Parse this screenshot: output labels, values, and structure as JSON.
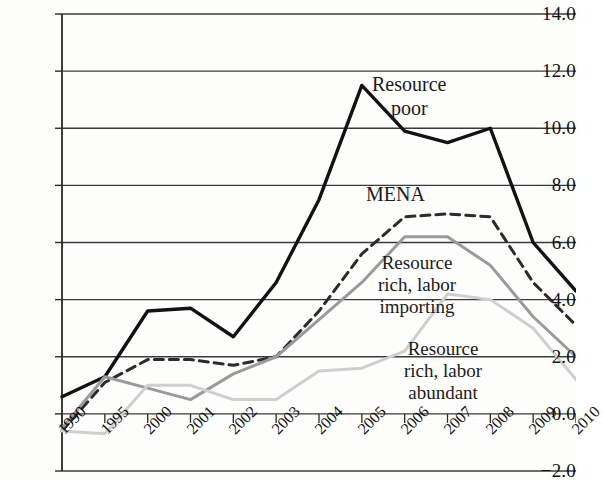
{
  "chart_data": {
    "type": "line",
    "title": "",
    "subtitle": "",
    "xlabel": "",
    "ylabel": "",
    "categories": [
      "1990",
      "1995",
      "2000",
      "2001",
      "2002",
      "2003",
      "2004",
      "2005",
      "2006",
      "2007",
      "2008",
      "2009",
      "2010"
    ],
    "ylim": [
      -2.0,
      14.0
    ],
    "ytick_values": [
      14.0,
      12.0,
      10.0,
      8.0,
      6.0,
      4.0,
      2.0,
      0.0,
      -2.0
    ],
    "ytick_labels": [
      "14.0",
      "12.0",
      "10.0",
      "8.0",
      "6.0",
      "4.0",
      "2.0",
      "0.0",
      "-2.0"
    ],
    "grid": "horizontal",
    "legend": "inline-annotations",
    "series": [
      {
        "name": "Resource poor",
        "style": "solid",
        "color": "#121212",
        "width": 3.4,
        "values": [
          0.6,
          1.3,
          3.6,
          3.7,
          2.7,
          4.6,
          7.5,
          11.5,
          9.9,
          9.5,
          10.0,
          6.0,
          4.3
        ]
      },
      {
        "name": "MENA",
        "style": "dashed",
        "color": "#2b2b2b",
        "width": 3.0,
        "values": [
          -0.6,
          1.1,
          1.9,
          1.9,
          1.7,
          2.0,
          3.6,
          5.6,
          6.9,
          7.0,
          6.9,
          4.6,
          3.1
        ]
      },
      {
        "name": "Resource rich, labor importing",
        "style": "solid",
        "color": "#9a9a9a",
        "width": 3.0,
        "values": [
          -0.5,
          1.3,
          0.9,
          0.5,
          1.4,
          2.0,
          3.3,
          4.6,
          6.2,
          6.2,
          5.2,
          3.4,
          2.0
        ]
      },
      {
        "name": "Resource rich, labor abundant",
        "style": "solid",
        "color": "#cfcfcf",
        "width": 3.0,
        "values": [
          -0.6,
          -0.7,
          1.0,
          1.0,
          0.5,
          0.5,
          1.5,
          1.6,
          2.2,
          4.2,
          4.0,
          3.0,
          1.2
        ]
      }
    ],
    "annotations": [
      {
        "id": "poor",
        "lines": [
          "Resource",
          "poor"
        ]
      },
      {
        "id": "mena",
        "lines": [
          "MENA"
        ]
      },
      {
        "id": "rich_importing",
        "lines": [
          "Resource",
          "rich, labor",
          "importing"
        ]
      },
      {
        "id": "rich_abundant",
        "lines": [
          "Resource",
          "rich, labor",
          "abundant"
        ]
      }
    ]
  }
}
